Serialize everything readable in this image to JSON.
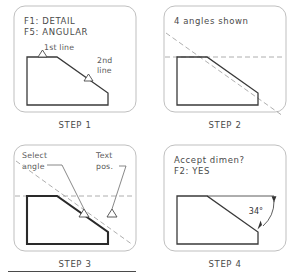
{
  "document": {
    "title": "Angular dimension procedure — four step panels",
    "footer_rule": true
  },
  "panels": [
    {
      "id": "step-1",
      "caption": "STEP 1",
      "prompt_lines": [
        "F1: DETAIL",
        "F5: ANGULAR"
      ],
      "annotations": [
        {
          "name": "first-line-label",
          "text": "1st line"
        },
        {
          "name": "second-line-label-row1",
          "text": "2nd"
        },
        {
          "name": "second-line-label-row2",
          "text": "line"
        }
      ],
      "markers": [
        "pick-marker-top-edge",
        "pick-marker-slope-edge"
      ],
      "construction_lines": []
    },
    {
      "id": "step-2",
      "caption": "STEP 2",
      "prompt_lines": [
        "4 angles shown"
      ],
      "annotations": [],
      "markers": [],
      "construction_lines": [
        "horizontal-extension",
        "slope-extension"
      ]
    },
    {
      "id": "step-3",
      "caption": "STEP 3",
      "prompt_lines": [],
      "annotations": [
        {
          "name": "select-angle-label-row1",
          "text": "Select"
        },
        {
          "name": "select-angle-label-row2",
          "text": "angle"
        },
        {
          "name": "text-pos-label-row1",
          "text": "Text"
        },
        {
          "name": "text-pos-label-row2",
          "text": "pos."
        }
      ],
      "markers": [
        "pick-marker-angle",
        "pick-marker-text-position"
      ],
      "construction_lines": [
        "horizontal-extension",
        "slope-extension"
      ]
    },
    {
      "id": "step-4",
      "caption": "STEP 4",
      "prompt_lines": [
        "Accept dimen?",
        "F2: YES"
      ],
      "annotations": [],
      "markers": [],
      "construction_lines": [],
      "dimension": {
        "name": "angle-dimension",
        "value": "34",
        "unit": "°",
        "label": "34°"
      }
    }
  ],
  "colors": {
    "object_line": "#3a3a3a",
    "construction_line": "#9a9a9a",
    "frame": "#b8b8b8",
    "text": "#4a4a4a",
    "dimension_text": "#333333"
  }
}
